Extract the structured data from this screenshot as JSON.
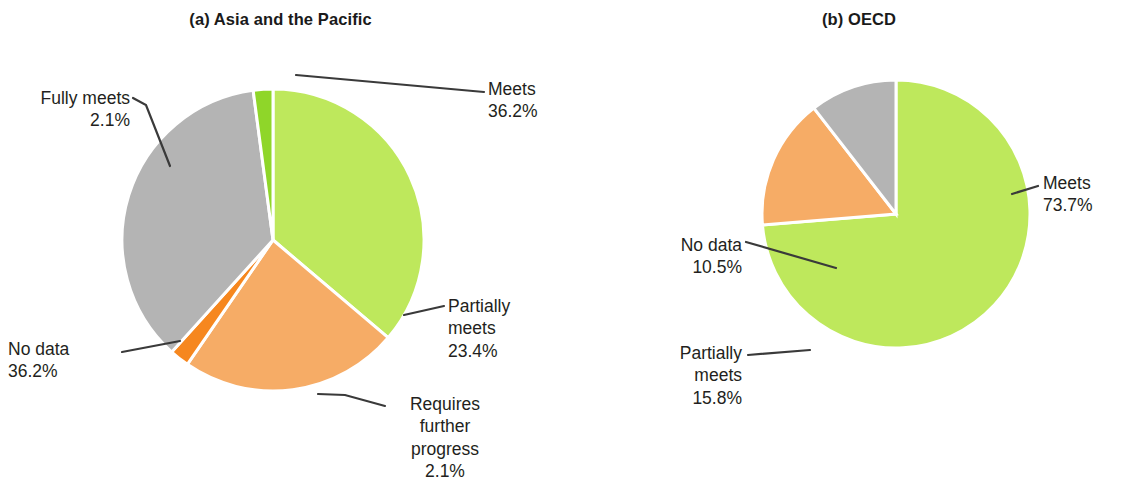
{
  "figure": {
    "background": "#ffffff",
    "width": 1143,
    "height": 489
  },
  "palette": {
    "meets_green": "#BEE85C",
    "fully_meets_green": "#8FD629",
    "partially_meets_orange": "#F6AC66",
    "requires_progress_orange": "#F6871F",
    "no_data_gray": "#B4B4B4",
    "leader_line": "#3a3a3a",
    "text": "#231f20",
    "slice_gap": "#ffffff"
  },
  "panels": [
    {
      "id": "a",
      "title": "(a) Asia and the Pacific",
      "callouts": {
        "meets": {
          "label": "Meets",
          "value": "36.2%"
        },
        "fully": {
          "label": "Fully meets",
          "value": "2.1%"
        },
        "nodata": {
          "label": "No data",
          "value": "36.2%"
        },
        "partially": {
          "label1": "Partially",
          "label2": "meets",
          "value": "23.4%"
        },
        "requires": {
          "label1": "Requires",
          "label2": "further",
          "label3": "progress",
          "value": "2.1%"
        }
      }
    },
    {
      "id": "b",
      "title": "(b) OECD",
      "callouts": {
        "meets": {
          "label": "Meets",
          "value": "73.7%"
        },
        "nodata": {
          "label": "No data",
          "value": "10.5%"
        },
        "partially": {
          "label1": "Partially",
          "label2": "meets",
          "value": "15.8%"
        }
      }
    }
  ],
  "chart_data": [
    {
      "type": "pie",
      "title": "(a) Asia and the Pacific",
      "labels": [
        "Meets",
        "Partially meets",
        "Requires further progress",
        "No data",
        "Fully meets"
      ],
      "values": [
        36.2,
        23.4,
        2.1,
        36.2,
        2.1
      ],
      "value_labels": [
        "36.2%",
        "23.4%",
        "2.1%",
        "36.2%",
        "2.1%"
      ],
      "colors": [
        "#BEE85C",
        "#F6AC66",
        "#F6871F",
        "#B4B4B4",
        "#8FD629"
      ],
      "units": "percent",
      "start_angle_deg": 0,
      "direction": "clockwise",
      "legend": "callout-labels",
      "grid": false
    },
    {
      "type": "pie",
      "title": "(b) OECD",
      "labels": [
        "Meets",
        "Partially meets",
        "No data"
      ],
      "values": [
        73.7,
        15.8,
        10.5
      ],
      "value_labels": [
        "73.7%",
        "15.8%",
        "10.5%"
      ],
      "colors": [
        "#BEE85C",
        "#F6AC66",
        "#B4B4B4"
      ],
      "units": "percent",
      "start_angle_deg": 0,
      "direction": "clockwise",
      "legend": "callout-labels",
      "grid": false
    }
  ]
}
